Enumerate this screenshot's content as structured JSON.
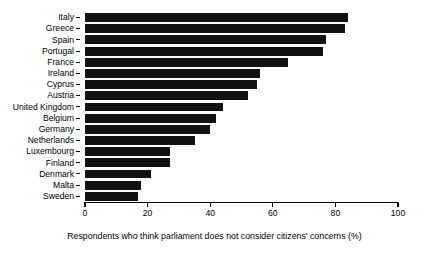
{
  "chart_data": {
    "type": "bar",
    "orientation": "horizontal",
    "title": "",
    "xlabel": "Respondents who think parliament does not consider citizens' concerns (%)",
    "ylabel": "",
    "xlim": [
      0,
      100
    ],
    "xticks": [
      0,
      20,
      40,
      60,
      80,
      100
    ],
    "grid": false,
    "legend": null,
    "bar_color": "#111111",
    "categories": [
      "Italy",
      "Greece",
      "Spain",
      "Portugal",
      "France",
      "Ireland",
      "Cyprus",
      "Austria",
      "United Kingdom",
      "Belgium",
      "Germany",
      "Netherlands",
      "Luxembourg",
      "Finland",
      "Denmark",
      "Malta",
      "Sweden"
    ],
    "values": [
      84,
      83,
      77,
      76,
      65,
      56,
      55,
      52,
      44,
      42,
      40,
      35,
      27,
      27,
      21,
      18,
      17
    ]
  }
}
